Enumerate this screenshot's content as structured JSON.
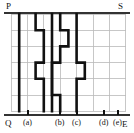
{
  "figure": {
    "type": "lattice-path-diagram",
    "corner_labels": {
      "top_left": "P",
      "top_right": "S",
      "bottom_left": "Q",
      "bottom_right": "E"
    },
    "bottom_tick_labels": [
      {
        "text": "(a)",
        "x": 23
      },
      {
        "text": "(b)",
        "x": 55
      },
      {
        "text": "(c)",
        "x": 72
      },
      {
        "text": "(d)",
        "x": 99
      },
      {
        "text": "(e)",
        "x": 113
      }
    ],
    "grid": {
      "columns": 7,
      "rows": 6,
      "left": 11,
      "top": 14,
      "cell_width": 16.4,
      "cell_height": 16.2,
      "line_color": "#b9b9b9",
      "line_width": 0.8
    },
    "path_color": "#111111",
    "path_width": 2.6,
    "paths": [
      {
        "name": "path-a",
        "points": [
          [
            1,
            0
          ],
          [
            1,
            6
          ]
        ]
      },
      {
        "name": "path-b",
        "points": [
          [
            3,
            0
          ],
          [
            3,
            1
          ],
          [
            4,
            1
          ],
          [
            4,
            3
          ],
          [
            3,
            3
          ],
          [
            3,
            4
          ],
          [
            4,
            4
          ],
          [
            4,
            6
          ]
        ]
      },
      {
        "name": "path-c",
        "points": [
          [
            5,
            0
          ],
          [
            5,
            6
          ]
        ]
      },
      {
        "name": "path-d",
        "points": [
          [
            6,
            0
          ],
          [
            6,
            1
          ],
          [
            7,
            1
          ],
          [
            7,
            2
          ],
          [
            6,
            2
          ],
          [
            6,
            3
          ],
          [
            5,
            3
          ],
          [
            5,
            5
          ],
          [
            6,
            5
          ],
          [
            6,
            6
          ]
        ]
      },
      {
        "name": "path-e",
        "points": [
          [
            8,
            0
          ],
          [
            8,
            3
          ],
          [
            9,
            3
          ],
          [
            9,
            4
          ],
          [
            8,
            4
          ],
          [
            8,
            6
          ]
        ]
      }
    ],
    "frame": {
      "top_rule_y": 13,
      "bottom_rule_y": 115,
      "rule_color": "#333333"
    }
  }
}
